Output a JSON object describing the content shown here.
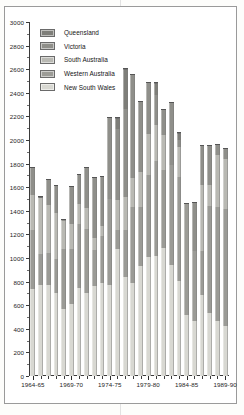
{
  "chart_data": {
    "type": "bar",
    "subtype": "stacked-vertical",
    "title": "",
    "xlabel": "",
    "ylabel": "",
    "ylim": [
      0,
      3000
    ],
    "ytick_step": 200,
    "yticks": [
      0,
      200,
      400,
      600,
      800,
      1000,
      1200,
      1400,
      1600,
      1800,
      2000,
      2200,
      2400,
      2600,
      2800,
      3000
    ],
    "ytick_labels": [
      "0",
      "200",
      "400",
      "600",
      "800",
      "1000",
      "1200",
      "1400",
      "1600",
      "1800",
      "2000",
      "2200",
      "2400",
      "2600",
      "2800",
      "3000"
    ],
    "grid": false,
    "legend_position": "top-left",
    "categories": [
      "1964-65",
      "1965-66",
      "1966-67",
      "1967-68",
      "1968-69",
      "1969-70",
      "1970-71",
      "1971-72",
      "1972-73",
      "1973-74",
      "1974-75",
      "1975-76",
      "1976-77",
      "1977-78",
      "1978-79",
      "1979-80",
      "1980-81",
      "1981-82",
      "1982-83",
      "1983-84",
      "1984-85",
      "1985-86",
      "1986-87",
      "1987-88",
      "1988-89",
      "1989-90"
    ],
    "xtick_labels": [
      "1964-65",
      "1969-70",
      "1974-75",
      "1979-80",
      "1984-85",
      "1989-90"
    ],
    "xtick_label_indices": [
      0,
      5,
      10,
      15,
      20,
      25
    ],
    "series": [
      {
        "name": "New South Wales",
        "color": "#d8d8d2",
        "values": [
          740,
          770,
          770,
          700,
          565,
          610,
          745,
          700,
          760,
          785,
          770,
          1080,
          835,
          785,
          935,
          1010,
          1020,
          1085,
          945,
          805,
          520,
          465,
          690,
          530,
          465,
          420
        ]
      },
      {
        "name": "Western Australia",
        "color": "#9b9b96",
        "values": [
          500,
          260,
          270,
          290,
          510,
          465,
          545,
          550,
          310,
          400,
          730,
          160,
          405,
          650,
          500,
          695,
          800,
          665,
          840,
          880,
          940,
          595,
          370,
          910,
          970,
          995
        ]
      },
      {
        "name": "South Australia",
        "color": "#b9b9b3",
        "values": [
          290,
          480,
          410,
          390,
          235,
          215,
          165,
          175,
          100,
          85,
          0,
          255,
          280,
          240,
          290,
          350,
          305,
          290,
          0,
          260,
          0,
          0,
          560,
          180,
          440,
          425
        ]
      },
      {
        "name": "Victoria",
        "color": "#8f8f8a",
        "values": [
          230,
          0,
          210,
          230,
          10,
          310,
          250,
          340,
          510,
          420,
          690,
          600,
          740,
          875,
          600,
          425,
          255,
          215,
          530,
          55,
          0,
          405,
          330,
          330,
          80,
          85
        ]
      },
      {
        "name": "Queensland",
        "color": "#7e7e79",
        "values": [
          0,
          10,
          0,
          0,
          0,
          0,
          0,
          0,
          0,
          0,
          0,
          95,
          340,
          0,
          0,
          0,
          100,
          0,
          0,
          60,
          0,
          0,
          0,
          0,
          0,
          0
        ]
      }
    ],
    "totals": [
      1760,
      1520,
      1660,
      1610,
      1320,
      1600,
      1705,
      1765,
      1680,
      1690,
      2190,
      2190,
      2600,
      2550,
      2325,
      2480,
      2480,
      2255,
      2315,
      2060,
      1460,
      1465,
      1950,
      1950,
      1955,
      1925
    ]
  },
  "legend": {
    "items": [
      {
        "label": "Queensland",
        "color": "#7e7e79"
      },
      {
        "label": "Victoria",
        "color": "#8f8f8a"
      },
      {
        "label": "South Australia",
        "color": "#b9b9b3"
      },
      {
        "label": "Western Australia",
        "color": "#9b9b96"
      },
      {
        "label": "New South Wales",
        "color": "#d8d8d2"
      }
    ]
  },
  "colors": {
    "axis": "#3a3a3a",
    "text": "#1c1c1c",
    "frame": "#9a9a9a",
    "page_background": "#fdfdfb",
    "plot_background": "#ffffff"
  }
}
